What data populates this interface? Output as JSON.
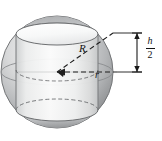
{
  "figure": {
    "labels": {
      "sphere_radius": "R",
      "cylinder_radius": "r",
      "half_height_numerator": "h",
      "half_height_denominator": "2"
    },
    "icons": {
      "sphere": "sphere-icon",
      "cylinder": "cylinder-icon",
      "radius_arrow": "radius-arrow-icon",
      "dimension_arrow": "dimension-arrow-icon"
    },
    "colors": {
      "sphere_shadow": "#8d8f91",
      "sphere_mid": "#b9bbbd",
      "sphere_light": "#e3e4e5",
      "cylinder_face": "#f2f3f3",
      "cylinder_top": "#fcfcfc",
      "outline": "#6e7072",
      "dashed": "#2b2b2b",
      "text": "#111111",
      "background": "#ffffff"
    },
    "geometry": {
      "sphere_center_x": 57,
      "sphere_center_y": 72,
      "sphere_radius_px": 56,
      "cylinder_radius_px": 41,
      "cylinder_half_height_px": 38,
      "ellipse_ry": 11
    }
  }
}
